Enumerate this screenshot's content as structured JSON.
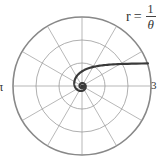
{
  "chart_data": {
    "type": "line",
    "coordinate_system": "polar",
    "title": "",
    "annotation": {
      "lhs": "r",
      "equals": "=",
      "numerator": "1",
      "denominator": "θ"
    },
    "tick_labels": {
      "theta_0": "3",
      "theta_pi": "π"
    },
    "radial_grid": [
      1,
      2,
      3
    ],
    "angular_grid_step_deg": 30,
    "rlim": [
      0,
      3
    ],
    "series": [
      {
        "name": "r = 1/θ",
        "equation": "r = 1/θ",
        "theta_range": [
          0.33,
          12.6
        ],
        "asymptote": "y = 1"
      }
    ],
    "colors": {
      "curve": "#3a3a3a",
      "grid": "#9a9a9a",
      "outer": "#888888"
    }
  }
}
